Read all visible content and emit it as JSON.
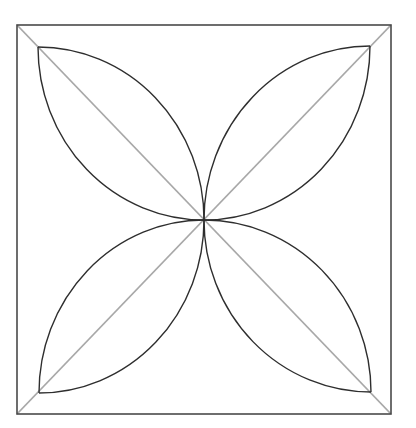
{
  "diagram": {
    "type": "geometric-figure",
    "colors": {
      "background": "#ffffff",
      "frame": "#4a4a4a",
      "diagonals": "#a8a8a8",
      "petals": "#2e2e2e"
    },
    "square": {
      "x1": 17,
      "y1": 25,
      "x2": 391,
      "y2": 414
    },
    "center": {
      "x": 204,
      "y": 220
    },
    "diagonals": [
      {
        "name": "diagonal-tl-br",
        "x1": 17,
        "y1": 25,
        "x2": 391,
        "y2": 414
      },
      {
        "name": "diagonal-tr-bl",
        "x1": 391,
        "y1": 25,
        "x2": 17,
        "y2": 414
      }
    ],
    "petals": [
      {
        "name": "petal-top-left",
        "tip": [
          38,
          47
        ],
        "arcs": [
          "M38,47 A166,173 0 0 1 204,220",
          "M38,47 A166,173 0 0 0 204,220"
        ]
      },
      {
        "name": "petal-top-right",
        "tip": [
          370,
          46
        ],
        "arcs": [
          "M370,46 A166,174 0 0 0 204,220",
          "M370,46 A166,174 0 0 1 204,220"
        ]
      },
      {
        "name": "petal-bottom-left",
        "tip": [
          39,
          393
        ],
        "arcs": [
          "M39,393 A165,173 0 0 0 204,220",
          "M39,393 A165,173 0 0 1 204,220"
        ]
      },
      {
        "name": "petal-bottom-right",
        "tip": [
          371,
          392
        ],
        "arcs": [
          "M371,392 A167,172 0 0 1 204,220",
          "M371,392 A167,172 0 0 0 204,220"
        ]
      }
    ]
  }
}
